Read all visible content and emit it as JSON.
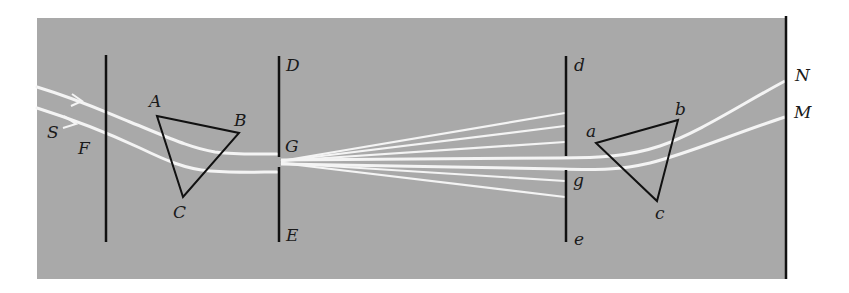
{
  "figure": {
    "background_color": "#a9a9a9",
    "ray_color": "#f4f4f4",
    "line_color": "#111111"
  },
  "labels": {
    "S": "S",
    "F": "F",
    "A": "A",
    "B": "B",
    "C": "C",
    "D": "D",
    "G": "G",
    "E": "E",
    "d": "d",
    "g": "g",
    "e": "e",
    "a": "a",
    "b": "b",
    "c": "c",
    "N": "N",
    "M": "M"
  },
  "elements": {
    "slit_F": {
      "label": "F",
      "x": 106,
      "y_top": 55,
      "y_bottom": 242
    },
    "prism_1": {
      "vertices": {
        "A": [
          157,
          116
        ],
        "B": [
          239,
          133
        ],
        "C": [
          183,
          197
        ]
      }
    },
    "board_DE": {
      "x": 279,
      "y_top": 56,
      "y_bottom": 242,
      "hole_label": "G"
    },
    "board_de": {
      "x": 566,
      "y_top": 56,
      "y_bottom": 242,
      "hole_label": "g"
    },
    "prism_2": {
      "vertices": {
        "a": [
          596,
          143
        ],
        "b": [
          678,
          120
        ],
        "c": [
          657,
          201
        ]
      }
    },
    "wall": {
      "x": 786,
      "y_top": 16,
      "y_bottom": 279,
      "spot_labels": [
        "N",
        "M"
      ]
    }
  }
}
